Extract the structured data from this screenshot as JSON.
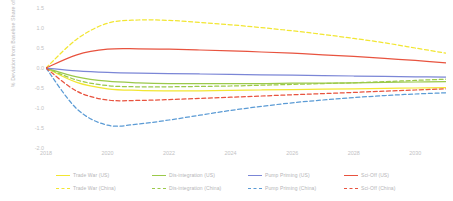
{
  "chart_data": {
    "type": "line",
    "title": "",
    "subtitle": "",
    "xlabel": "",
    "ylabel": "% Deviation from Baseline Share of GDP",
    "xlim": [
      2018,
      2031
    ],
    "ylim": [
      -2.0,
      1.5
    ],
    "grid": false,
    "legend_position": "bottom",
    "x_tick_labels": [
      "2018",
      "2020",
      "2022",
      "2024",
      "2026",
      "2028",
      "2030"
    ],
    "x_tick_values": [
      2018,
      2020,
      2022,
      2024,
      2026,
      2028,
      2030
    ],
    "y_tick_labels": [
      "1.5",
      "1.0",
      "0.5",
      "0.0",
      "-0.5",
      "-1.0",
      "-1.5",
      "-2.0"
    ],
    "y_tick_values": [
      1.5,
      1.0,
      0.5,
      0.0,
      -0.5,
      -1.0,
      -1.5,
      -2.0
    ],
    "x": [
      2018,
      2019,
      2020,
      2021,
      2022,
      2023,
      2024,
      2025,
      2026,
      2027,
      2028,
      2029,
      2030,
      2031
    ],
    "series": [
      {
        "name": "Trade War (US)",
        "color": "#f2e632",
        "style": "solid",
        "region": "US",
        "scenario": "Trade War",
        "values": [
          0.0,
          -0.36,
          -0.52,
          -0.56,
          -0.57,
          -0.57,
          -0.56,
          -0.55,
          -0.54,
          -0.53,
          -0.52,
          -0.51,
          -0.5,
          -0.49
        ]
      },
      {
        "name": "Trade War (China)",
        "color": "#f2e632",
        "style": "dashed",
        "region": "China",
        "scenario": "Trade War",
        "values": [
          0.0,
          0.72,
          1.12,
          1.2,
          1.19,
          1.14,
          1.08,
          1.01,
          0.93,
          0.84,
          0.74,
          0.63,
          0.5,
          0.37
        ]
      },
      {
        "name": "Dis-integration (US)",
        "color": "#9bc94a",
        "style": "solid",
        "region": "US",
        "scenario": "Dis-integration",
        "values": [
          0.0,
          -0.22,
          -0.33,
          -0.37,
          -0.39,
          -0.39,
          -0.39,
          -0.39,
          -0.38,
          -0.38,
          -0.37,
          -0.36,
          -0.35,
          -0.34
        ]
      },
      {
        "name": "Dis-integration (China)",
        "color": "#9bc94a",
        "style": "dashed",
        "region": "China",
        "scenario": "Dis-integration",
        "values": [
          0.0,
          -0.3,
          -0.44,
          -0.47,
          -0.47,
          -0.46,
          -0.45,
          -0.43,
          -0.41,
          -0.39,
          -0.37,
          -0.34,
          -0.31,
          -0.28
        ]
      },
      {
        "name": "Pump Priming (US)",
        "color": "#7b86d6",
        "style": "solid",
        "region": "US",
        "scenario": "Pump Priming",
        "values": [
          0.0,
          -0.07,
          -0.11,
          -0.13,
          -0.14,
          -0.15,
          -0.16,
          -0.17,
          -0.18,
          -0.19,
          -0.2,
          -0.21,
          -0.22,
          -0.23
        ]
      },
      {
        "name": "Pump Priming (China)",
        "color": "#5b9bd5",
        "style": "dashed",
        "region": "China",
        "scenario": "Pump Priming",
        "values": [
          0.0,
          -1.02,
          -1.43,
          -1.4,
          -1.3,
          -1.18,
          -1.06,
          -0.96,
          -0.87,
          -0.8,
          -0.74,
          -0.69,
          -0.65,
          -0.62
        ]
      },
      {
        "name": "Sci-Off (US)",
        "color": "#e8533f",
        "style": "solid",
        "region": "US",
        "scenario": "Sci-Off",
        "values": [
          0.0,
          0.33,
          0.47,
          0.48,
          0.47,
          0.45,
          0.43,
          0.4,
          0.37,
          0.33,
          0.29,
          0.24,
          0.19,
          0.13
        ]
      },
      {
        "name": "Sci-Off (China)",
        "color": "#e8533f",
        "style": "dashed",
        "region": "China",
        "scenario": "Sci-Off",
        "values": [
          0.0,
          -0.58,
          -0.8,
          -0.81,
          -0.79,
          -0.76,
          -0.73,
          -0.7,
          -0.67,
          -0.64,
          -0.61,
          -0.58,
          -0.55,
          -0.52
        ]
      }
    ]
  },
  "legend": {
    "items": [
      {
        "label": "Trade War (US)",
        "color": "#f2e632",
        "style": "solid"
      },
      {
        "label": "Trade War (China)",
        "color": "#f2e632",
        "style": "dashed"
      },
      {
        "label": "Dis-integration (US)",
        "color": "#9bc94a",
        "style": "solid"
      },
      {
        "label": "Dis-integration (China)",
        "color": "#9bc94a",
        "style": "dashed"
      },
      {
        "label": "Pump Priming (US)",
        "color": "#7b86d6",
        "style": "solid"
      },
      {
        "label": "Pump Priming (China)",
        "color": "#5b9bd5",
        "style": "dashed"
      },
      {
        "label": "Sci-Off (US)",
        "color": "#e8533f",
        "style": "solid"
      },
      {
        "label": "Sci-Off (China)",
        "color": "#e8533f",
        "style": "dashed"
      }
    ]
  }
}
